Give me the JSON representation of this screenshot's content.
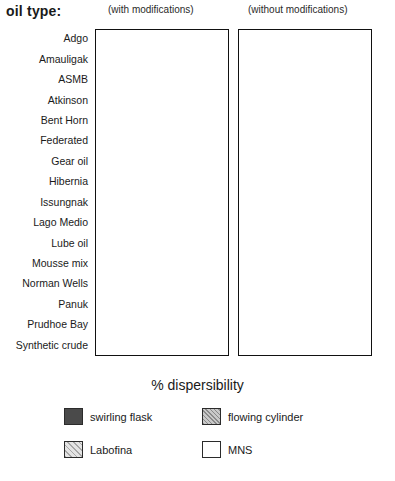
{
  "header": {
    "axis_title_label": "oil type:",
    "panel_left_caption": "(with modifications)",
    "panel_right_caption": "(without modifications)"
  },
  "axis": {
    "xlabel": "% dispersibility",
    "ticks": [
      0,
      10,
      20,
      30,
      40,
      50,
      60,
      70,
      80,
      90,
      100
    ]
  },
  "legend": {
    "items": [
      {
        "label": "swirling flask",
        "key": "swirling_flask",
        "color": "#4a4a4a"
      },
      {
        "label": "flowing cylinder",
        "key": "flowing_cylinder",
        "color": "#c9c9c9"
      },
      {
        "label": "Labofina",
        "key": "labofina",
        "color": "#e4e4e4"
      },
      {
        "label": "MNS",
        "key": "mns",
        "color": "#ffffff"
      }
    ]
  },
  "chart_data": {
    "type": "bar",
    "orientation": "horizontal",
    "title": "",
    "xlabel": "% dispersibility",
    "ylabel": "oil type:",
    "xlim": [
      0,
      100
    ],
    "grid": true,
    "legend_position": "bottom",
    "panels": [
      {
        "name": "with modifications"
      },
      {
        "name": "without modifications"
      }
    ],
    "series_names": [
      "swirling flask",
      "flowing cylinder",
      "Labofina",
      "MNS"
    ],
    "categories": [
      "Adgo",
      "Amauligak",
      "ASMB",
      "Atkinson",
      "Bent Horn",
      "Federated",
      "Gear oil",
      "Hibernia",
      "Issungnak",
      "Lago Medio",
      "Lube oil",
      "Mousse mix",
      "Norman Wells",
      "Panuk",
      "Prudhoe Bay",
      "Synthetic crude"
    ],
    "with_modifications": {
      "swirling flask": [
        82,
        72,
        50,
        30,
        46,
        44,
        42,
        18,
        6,
        26,
        10,
        38,
        58,
        98,
        8,
        42
      ],
      "flowing cylinder": [
        12,
        96,
        10,
        11,
        8,
        6,
        90,
        7,
        8,
        8,
        9,
        70,
        97,
        100,
        11,
        44
      ],
      "Labofina": [
        10,
        8,
        98,
        9,
        7,
        54,
        8,
        7,
        8,
        9,
        12,
        12,
        6,
        99,
        12,
        86
      ],
      "MNS": [
        75,
        60,
        73,
        12,
        49,
        31,
        30,
        11,
        62,
        9,
        28,
        21,
        20,
        97,
        14,
        29
      ]
    },
    "without_modifications": {
      "swirling flask": [
        63,
        70,
        36,
        24,
        20,
        38,
        25,
        9,
        49,
        32,
        19,
        62,
        97,
        8,
        53,
        47
      ],
      "flowing cylinder": [
        9,
        8,
        10,
        9,
        10,
        10,
        12,
        10,
        8,
        7,
        9,
        8,
        99,
        8,
        45,
        9
      ],
      "Labofina": [
        8,
        7,
        79,
        8,
        12,
        9,
        9,
        9,
        8,
        12,
        11,
        10,
        100,
        9,
        10,
        9
      ],
      "MNS": [
        88,
        91,
        45,
        54,
        56,
        17,
        37,
        33,
        76,
        26,
        23,
        69,
        96,
        25,
        16,
        86
      ]
    }
  }
}
